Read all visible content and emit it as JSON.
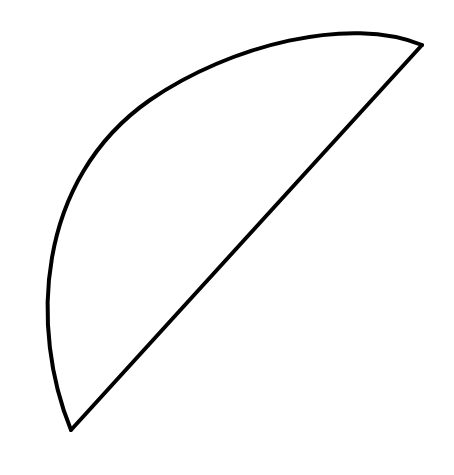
{
  "figure": {
    "background": "#ffffff",
    "stroke_color": "#000000",
    "stroke_width": 4,
    "shape": {
      "type": "circular-segment",
      "chord": {
        "x1": 71,
        "y1": 430,
        "x2": 422,
        "y2": 45
      },
      "arc_path": "M 71 430 C 30 330, 35 180, 150 100 C 230 45, 350 15, 422 45"
    }
  }
}
